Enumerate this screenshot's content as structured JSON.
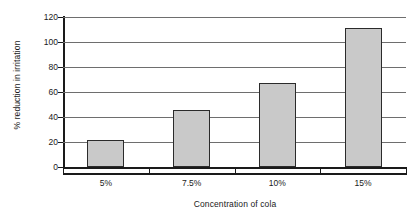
{
  "chart_data": {
    "type": "bar",
    "title": "",
    "subtitle": "",
    "categories": [
      "5%",
      "7.5%",
      "10%",
      "15%"
    ],
    "values": [
      22,
      45.5,
      67.5,
      111
    ],
    "xlabel": "Concentration of cola",
    "ylabel": "% reduction in irritation",
    "ylim": [
      0,
      120
    ],
    "ytick_labels": [
      "0",
      "20",
      "40",
      "60",
      "80",
      "100",
      "120"
    ],
    "ytick_values": [
      0,
      20,
      40,
      60,
      80,
      100,
      120
    ],
    "grid": "horizontal",
    "legend": "none",
    "annotations": [],
    "colors": {
      "bar_fill": "#c9c9c9",
      "bar_border": "#2b2b2b",
      "gridline": "#6e6e6e",
      "axis": "#1a1a1a",
      "background": "#ffffff",
      "text": "#1a1a1a"
    }
  }
}
